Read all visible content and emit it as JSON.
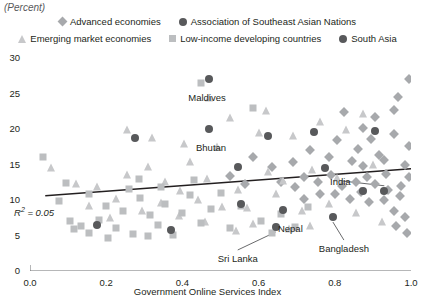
{
  "units": "(Percent)",
  "legend": {
    "rows": [
      [
        {
          "label": "Advanced economies",
          "marker": "diamond",
          "color": "#a7a9ac"
        },
        {
          "label": "Association of Southeast Asian Nations",
          "marker": "circle",
          "color": "#58595b"
        }
      ],
      [
        {
          "label": "Emerging market economies",
          "marker": "triangle",
          "color": "#c7c8ca"
        },
        {
          "label": "Low-income developing countries",
          "marker": "square",
          "color": "#bcbec0"
        },
        {
          "label": "South Asia",
          "marker": "circle",
          "color": "#58595b"
        }
      ]
    ]
  },
  "chart_data": {
    "type": "scatter",
    "title": "",
    "xlabel": "Government Online Services Index",
    "ylabel": "",
    "units": "(Percent)",
    "xlim": [
      0.0,
      1.0
    ],
    "ylim": [
      0,
      30
    ],
    "xticks": [
      "0.0",
      "0.2",
      "0.4",
      "0.6",
      "0.8",
      "1.0"
    ],
    "xtick_values": [
      0.0,
      0.2,
      0.4,
      0.6,
      0.8,
      1.0
    ],
    "yticks": [
      "0",
      "5",
      "10",
      "15",
      "20",
      "25",
      "30"
    ],
    "ytick_values": [
      0,
      5,
      10,
      15,
      20,
      25,
      30
    ],
    "grid": false,
    "legend_position": "top",
    "r_squared": 0.05,
    "r_squared_label": "R2 = 0.05",
    "trendline": {
      "x": [
        0.04,
        1.0
      ],
      "y": [
        10.6,
        14.4
      ],
      "color": "#231f20"
    },
    "annotations": [
      {
        "text": "Maldives",
        "x": 0.47,
        "y": 27.0,
        "label_dx": -2,
        "label_dy": 13,
        "leader": false
      },
      {
        "text": "Bhutan",
        "x": 0.47,
        "y": 20.0,
        "label_dx": 2,
        "label_dy": 13,
        "leader": false
      },
      {
        "text": "India",
        "x": 0.93,
        "y": 11.3,
        "label_dx": -44,
        "label_dy": -15,
        "leader": true
      },
      {
        "text": "Nepal",
        "x": 0.665,
        "y": 8.6,
        "label_dx": 7,
        "label_dy": 13,
        "leader": false
      },
      {
        "text": "Sri Lanka",
        "x": 0.645,
        "y": 6.2,
        "label_dx": -38,
        "label_dy": 26,
        "leader": true
      },
      {
        "text": "Bangladesh",
        "x": 0.795,
        "y": 7.6,
        "label_dx": 11,
        "label_dy": 26,
        "leader": true
      }
    ],
    "series": [
      {
        "name": "Advanced economies",
        "marker": "diamond",
        "color": "#a7a9ac",
        "points": [
          [
            0.995,
            27.0
          ],
          [
            0.965,
            24.5
          ],
          [
            0.905,
            21.7
          ],
          [
            0.825,
            22.4
          ],
          [
            0.875,
            20.1
          ],
          [
            0.955,
            19.3
          ],
          [
            0.995,
            17.6
          ],
          [
            0.915,
            16.3
          ],
          [
            0.845,
            15.5
          ],
          [
            0.785,
            16.0
          ],
          [
            0.735,
            17.0
          ],
          [
            0.69,
            15.3
          ],
          [
            0.635,
            14.6
          ],
          [
            0.585,
            16.1
          ],
          [
            0.935,
            13.6
          ],
          [
            0.885,
            13.3
          ],
          [
            0.855,
            12.6
          ],
          [
            0.905,
            12.2
          ],
          [
            0.94,
            11.4
          ],
          [
            0.975,
            12.0
          ],
          [
            0.995,
            13.3
          ],
          [
            0.82,
            12.0
          ],
          [
            0.79,
            13.5
          ],
          [
            0.755,
            12.6
          ],
          [
            0.72,
            13.2
          ],
          [
            0.97,
            10.5
          ],
          [
            0.93,
            10.0
          ],
          [
            0.89,
            9.7
          ],
          [
            0.955,
            8.5
          ],
          [
            0.985,
            7.6
          ],
          [
            0.96,
            6.3
          ],
          [
            0.99,
            5.4
          ],
          [
            0.87,
            11.1
          ],
          [
            0.84,
            10.2
          ],
          [
            0.565,
            12.3
          ],
          [
            0.525,
            13.4
          ],
          [
            0.695,
            11.8
          ],
          [
            0.66,
            12.5
          ],
          [
            0.76,
            10.9
          ],
          [
            0.72,
            10.2
          ],
          [
            0.8,
            10.8
          ],
          [
            0.875,
            14.8
          ],
          [
            0.93,
            15.6
          ],
          [
            0.985,
            15.0
          ],
          [
            0.86,
            17.2
          ],
          [
            0.805,
            18.4
          ],
          [
            0.895,
            18.6
          ],
          [
            0.955,
            22.7
          ]
        ]
      },
      {
        "name": "Emerging market economies",
        "marker": "triangle",
        "color": "#c7c8ca",
        "points": [
          [
            0.055,
            14.5
          ],
          [
            0.12,
            12.3
          ],
          [
            0.175,
            11.8
          ],
          [
            0.225,
            10.2
          ],
          [
            0.255,
            13.5
          ],
          [
            0.31,
            14.6
          ],
          [
            0.355,
            12.5
          ],
          [
            0.395,
            11.3
          ],
          [
            0.42,
            15.4
          ],
          [
            0.44,
            10.0
          ],
          [
            0.465,
            13.0
          ],
          [
            0.49,
            17.4
          ],
          [
            0.505,
            9.0
          ],
          [
            0.525,
            21.5
          ],
          [
            0.545,
            11.4
          ],
          [
            0.57,
            8.9
          ],
          [
            0.6,
            19.5
          ],
          [
            0.625,
            14.0
          ],
          [
            0.645,
            10.8
          ],
          [
            0.665,
            12.7
          ],
          [
            0.69,
            19.0
          ],
          [
            0.715,
            8.4
          ],
          [
            0.74,
            14.2
          ],
          [
            0.76,
            21.0
          ],
          [
            0.785,
            9.4
          ],
          [
            0.805,
            13.1
          ],
          [
            0.83,
            19.8
          ],
          [
            0.855,
            8.2
          ],
          [
            0.875,
            22.1
          ],
          [
            0.9,
            15.0
          ],
          [
            0.345,
            9.6
          ],
          [
            0.295,
            8.5
          ],
          [
            0.21,
            7.4
          ],
          [
            0.155,
            9.2
          ],
          [
            0.585,
            6.6
          ],
          [
            0.46,
            6.9
          ],
          [
            0.39,
            7.7
          ],
          [
            0.62,
            22.5
          ],
          [
            0.735,
            6.4
          ],
          [
            0.68,
            5.9
          ],
          [
            0.54,
            5.6
          ],
          [
            0.925,
            6.9
          ],
          [
            0.47,
            24.3
          ],
          [
            0.405,
            17.9
          ],
          [
            0.32,
            18.7
          ],
          [
            0.255,
            19.9
          ]
        ]
      },
      {
        "name": "Low-income developing countries",
        "marker": "square",
        "color": "#bcbec0",
        "points": [
          [
            0.035,
            16.0
          ],
          [
            0.075,
            9.9
          ],
          [
            0.105,
            7.0
          ],
          [
            0.135,
            6.3
          ],
          [
            0.155,
            5.4
          ],
          [
            0.18,
            7.2
          ],
          [
            0.2,
            9.1
          ],
          [
            0.225,
            6.1
          ],
          [
            0.245,
            8.4
          ],
          [
            0.27,
            5.2
          ],
          [
            0.29,
            10.3
          ],
          [
            0.315,
            7.9
          ],
          [
            0.335,
            6.5
          ],
          [
            0.355,
            9.4
          ],
          [
            0.375,
            5.1
          ],
          [
            0.4,
            8.1
          ],
          [
            0.42,
            10.7
          ],
          [
            0.45,
            6.8
          ],
          [
            0.475,
            8.8
          ],
          [
            0.5,
            11.0
          ],
          [
            0.525,
            6.0
          ],
          [
            0.555,
            9.2
          ],
          [
            0.585,
            23.0
          ],
          [
            0.45,
            26.5
          ],
          [
            0.605,
            7.0
          ],
          [
            0.635,
            5.3
          ],
          [
            0.66,
            8.0
          ],
          [
            0.695,
            6.2
          ],
          [
            0.73,
            9.0
          ],
          [
            0.285,
            13.0
          ],
          [
            0.26,
            11.6
          ],
          [
            0.155,
            10.8
          ],
          [
            0.095,
            12.4
          ],
          [
            0.345,
            11.9
          ],
          [
            0.43,
            12.8
          ],
          [
            0.31,
            5.0
          ],
          [
            0.115,
            5.9
          ],
          [
            0.205,
            4.6
          ]
        ]
      },
      {
        "name": "Association of Southeast Asian Nations",
        "marker": "circle",
        "color": "#58595b",
        "points": [
          [
            0.275,
            18.7
          ],
          [
            0.625,
            19.0
          ],
          [
            0.745,
            19.6
          ],
          [
            0.905,
            19.7
          ],
          [
            0.775,
            14.5
          ],
          [
            0.875,
            11.3
          ],
          [
            0.555,
            9.4
          ],
          [
            0.175,
            6.5
          ]
        ]
      },
      {
        "name": "South Asia",
        "marker": "circle",
        "color": "#58595b",
        "points": [
          [
            0.47,
            27.0
          ],
          [
            0.47,
            20.0
          ],
          [
            0.545,
            14.6
          ],
          [
            0.665,
            8.6
          ],
          [
            0.645,
            6.2
          ],
          [
            0.795,
            7.6
          ],
          [
            0.93,
            11.3
          ],
          [
            0.37,
            5.8
          ]
        ]
      }
    ]
  }
}
